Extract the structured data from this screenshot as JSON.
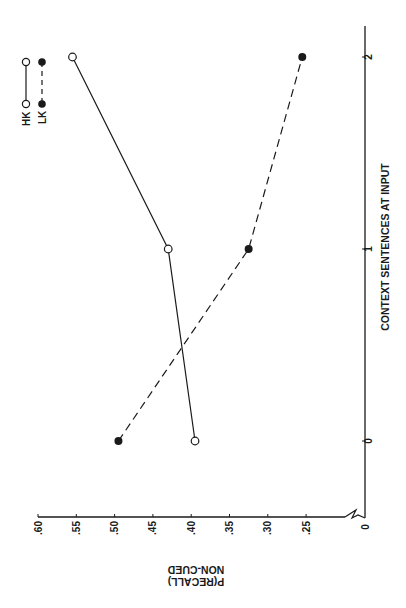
{
  "chart_data": {
    "type": "line",
    "orientation": "rotated 90 degrees (x-axis vertical on right, y-axis along bottom)",
    "title": "",
    "xlabel": "CONTEXT SENTENCES AT INPUT",
    "ylabel_lines": [
      "P(RECALL)",
      "NON-CUED"
    ],
    "x": [
      0,
      1,
      2
    ],
    "x_tick_labels": [
      "0",
      "1",
      "2"
    ],
    "y_ticks": [
      0.6,
      0.55,
      0.5,
      0.45,
      0.4,
      0.35,
      0.3,
      0.25
    ],
    "y_tick_labels": [
      ".60",
      ".55",
      ".50",
      ".45",
      ".40",
      ".35",
      ".30",
      ".25"
    ],
    "y_origin_label": "0",
    "y_axis_break": true,
    "ylim": [
      0.25,
      0.6
    ],
    "grid": false,
    "legend_position": "top-left",
    "series": [
      {
        "name": "HK",
        "marker": "open-circle",
        "line": "solid",
        "values": [
          0.395,
          0.43,
          0.555
        ]
      },
      {
        "name": "LK",
        "marker": "filled-circle",
        "line": "dashed",
        "values": [
          0.495,
          0.325,
          0.255
        ]
      }
    ]
  },
  "legend": {
    "items": [
      {
        "label": "HK",
        "marker": "open-circle",
        "line": "solid"
      },
      {
        "label": "LK",
        "marker": "filled-circle",
        "line": "dashed"
      }
    ]
  },
  "colors": {
    "ink": "#1a1a1a",
    "background": "#ffffff"
  }
}
